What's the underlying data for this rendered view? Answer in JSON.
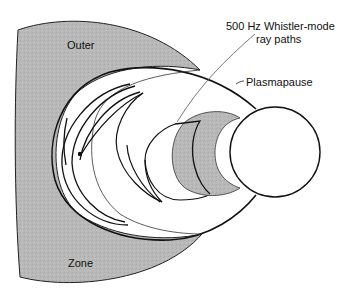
{
  "diagram": {
    "labels": {
      "outer": "Outer",
      "zone": "Zone",
      "ray_paths_line1": "500 Hz Whistler-mode",
      "ray_paths_line2": "ray paths",
      "plasmapause": "Plasmapause"
    },
    "regions": [
      {
        "name": "outer-radiation-zone",
        "fill": "#b8b8b8"
      },
      {
        "name": "inner-radiation-belt",
        "fill": "#b0b0b0"
      },
      {
        "name": "earth",
        "fill": "#ffffff"
      }
    ],
    "colors": {
      "background": "#ffffff",
      "shaded_region": "#b8b8b8",
      "line": "#111111",
      "leader_line": "#555555"
    }
  }
}
